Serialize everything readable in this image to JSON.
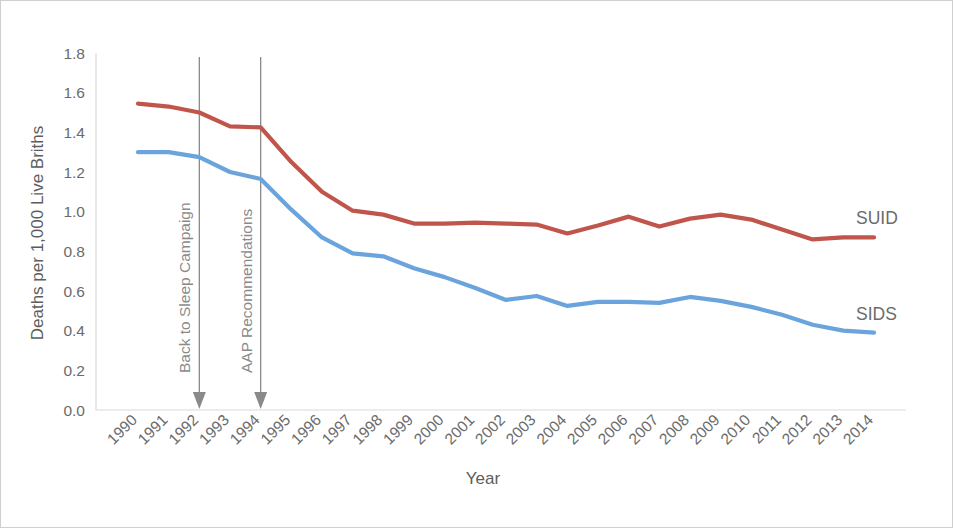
{
  "chart_data": {
    "type": "line",
    "title": "",
    "xlabel": "Year",
    "ylabel": "Deaths per 1,000 Live Briths",
    "ylim": [
      0.0,
      1.8
    ],
    "grid": false,
    "legend_position": "inline-right-end-labels",
    "categories": [
      1990,
      1991,
      1992,
      1993,
      1994,
      1995,
      1996,
      1997,
      1998,
      1999,
      2000,
      2001,
      2002,
      2003,
      2004,
      2005,
      2006,
      2007,
      2008,
      2009,
      2010,
      2011,
      2012,
      2013,
      2014
    ],
    "ytick_labels": [
      "0.0",
      "0.2",
      "0.4",
      "0.6",
      "0.8",
      "1.0",
      "1.2",
      "1.4",
      "1.6",
      "1.8"
    ],
    "ytick_values": [
      0.0,
      0.2,
      0.4,
      0.6,
      0.8,
      1.0,
      1.2,
      1.4,
      1.6,
      1.8
    ],
    "xtick_labels": [
      "1990",
      "1991",
      "1992",
      "1993",
      "1994",
      "1995",
      "1996",
      "1997",
      "1998",
      "1999",
      "2000",
      "2001",
      "2002",
      "2003",
      "2004",
      "2005",
      "2006",
      "2007",
      "2008",
      "2009",
      "2010",
      "2011",
      "2012",
      "2013",
      "2014"
    ],
    "series": [
      {
        "name": "SUID",
        "color": "#c0564b",
        "label": "SUID",
        "values": [
          1.545,
          1.53,
          1.5,
          1.43,
          1.425,
          1.25,
          1.1,
          1.005,
          0.985,
          0.94,
          0.94,
          0.945,
          0.94,
          0.935,
          0.89,
          0.93,
          0.975,
          0.925,
          0.965,
          0.985,
          0.96,
          0.91,
          0.86,
          0.87,
          0.87
        ]
      },
      {
        "name": "SIDS",
        "color": "#6ba4dd",
        "label": "SIDS",
        "values": [
          1.3,
          1.3,
          1.275,
          1.2,
          1.165,
          1.01,
          0.87,
          0.79,
          0.775,
          0.715,
          0.67,
          0.615,
          0.555,
          0.575,
          0.525,
          0.545,
          0.545,
          0.54,
          0.57,
          0.55,
          0.52,
          0.48,
          0.43,
          0.4,
          0.39
        ]
      }
    ],
    "annotations": [
      {
        "label": "Back to Sleep Campaign",
        "at_year": 1992,
        "kind": "vertical-arrow"
      },
      {
        "label": "AAP Recommendations",
        "at_year": 1994,
        "kind": "vertical-arrow"
      }
    ]
  }
}
